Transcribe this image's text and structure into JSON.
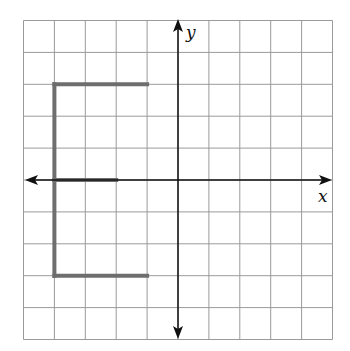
{
  "diagram": {
    "type": "coordinate-grid",
    "grid": {
      "x_min": -5,
      "x_max": 5,
      "y_min": -5,
      "y_max": 5,
      "color": "#9a9a9a"
    },
    "axes": {
      "x_label": "x",
      "y_label": "y",
      "color": "#111111"
    },
    "shape": {
      "name": "letter-E",
      "color": "#6e6e6e",
      "segments": [
        {
          "name": "spine",
          "from": [
            -4,
            3
          ],
          "to": [
            -4,
            -3
          ]
        },
        {
          "name": "top-bar",
          "from": [
            -4,
            3
          ],
          "to": [
            -1,
            3
          ]
        },
        {
          "name": "middle-bar",
          "from": [
            -4,
            0
          ],
          "to": [
            -2,
            0
          ]
        },
        {
          "name": "bottom-bar",
          "from": [
            -4,
            -3
          ],
          "to": [
            -1,
            -3
          ]
        }
      ]
    }
  }
}
